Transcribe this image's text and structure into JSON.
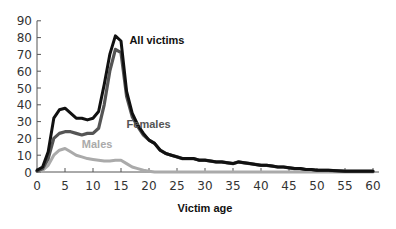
{
  "chart_data": {
    "type": "line",
    "title": "",
    "xlabel": "Victim age",
    "ylabel": "",
    "xlim": [
      0,
      60
    ],
    "ylim": [
      0,
      90
    ],
    "x_ticks": [
      0,
      5,
      10,
      15,
      20,
      25,
      30,
      35,
      40,
      45,
      50,
      55,
      60
    ],
    "y_ticks": [
      0,
      10,
      20,
      30,
      40,
      50,
      60,
      70,
      80,
      90
    ],
    "grid": false,
    "legend": "inline labels",
    "x": [
      0,
      1,
      2,
      3,
      4,
      5,
      6,
      7,
      8,
      9,
      10,
      11,
      12,
      13,
      14,
      15,
      16,
      17,
      18,
      19,
      20,
      21,
      22,
      23,
      24,
      25,
      26,
      27,
      28,
      29,
      30,
      31,
      32,
      33,
      34,
      35,
      36,
      37,
      38,
      39,
      40,
      41,
      42,
      43,
      44,
      45,
      46,
      47,
      48,
      49,
      50,
      52,
      55,
      58,
      60
    ],
    "series": [
      {
        "name": "All victims",
        "color": "#111111",
        "values": [
          1,
          3,
          12,
          32,
          37,
          38,
          35,
          32,
          32,
          31,
          32,
          36,
          52,
          70,
          81,
          78,
          48,
          35,
          28,
          23,
          19,
          17,
          13,
          11,
          10,
          9,
          8,
          8,
          8,
          7,
          7,
          6.5,
          6,
          6,
          5.5,
          5,
          6,
          5.5,
          5,
          4.5,
          4,
          4,
          3.5,
          3,
          3,
          2.5,
          2,
          2,
          1.5,
          1.5,
          1,
          1,
          0.5,
          0.5,
          0.5
        ]
      },
      {
        "name": "Females",
        "color": "#555555",
        "values": [
          0.5,
          2,
          8,
          20,
          23,
          24,
          24,
          23,
          22,
          23,
          23,
          26,
          40,
          60,
          73,
          71,
          45,
          33,
          27,
          22,
          19,
          17,
          13,
          11,
          10,
          9,
          8,
          8,
          8,
          7,
          7,
          6.5,
          6,
          6,
          5.5,
          5,
          6,
          5.5,
          5,
          4.5,
          4,
          4,
          3.5,
          3,
          3,
          2.5,
          2,
          2,
          1.5,
          1.5,
          1,
          1,
          0.5,
          0.5,
          0.5
        ]
      },
      {
        "name": "Males",
        "color": "#aaaaaa",
        "values": [
          0.5,
          1,
          4,
          10,
          13,
          14,
          12,
          10,
          9,
          8,
          7.5,
          7,
          6.5,
          6.5,
          7,
          7,
          5,
          3,
          2,
          1,
          0.5,
          0,
          0,
          0,
          0,
          0,
          0,
          0,
          0,
          0,
          0,
          0,
          0,
          0,
          0,
          0,
          0,
          0,
          0,
          0,
          0,
          0,
          0,
          0,
          0,
          0,
          0,
          0,
          0,
          0,
          0,
          0,
          0,
          0,
          0
        ]
      }
    ],
    "annotations": [
      {
        "text": "All victims",
        "x": 16.5,
        "y": 76
      },
      {
        "text": "Females",
        "x": 16,
        "y": 26
      },
      {
        "text": "Males",
        "x": 8,
        "y": 14
      }
    ]
  }
}
